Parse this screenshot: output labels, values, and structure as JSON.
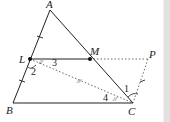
{
  "diagram": {
    "points": {
      "A": {
        "label": "A",
        "x": 50,
        "y": 10
      },
      "L": {
        "label": "L",
        "x": 30,
        "y": 59
      },
      "M": {
        "label": "M",
        "x": 90,
        "y": 59
      },
      "P": {
        "label": "P",
        "x": 148,
        "y": 59
      },
      "B": {
        "label": "B",
        "x": 13,
        "y": 103
      },
      "C": {
        "label": "C",
        "x": 133,
        "y": 103
      }
    },
    "angle_labels": {
      "a1": "1",
      "a2": "2",
      "a3": "3",
      "a4": "4"
    },
    "marks": {
      "equal_angle": "//",
      "mid_mark": "//"
    },
    "colors": {
      "line": "#222222",
      "dotted": "#444444",
      "strip": "#e2e2e2"
    }
  }
}
